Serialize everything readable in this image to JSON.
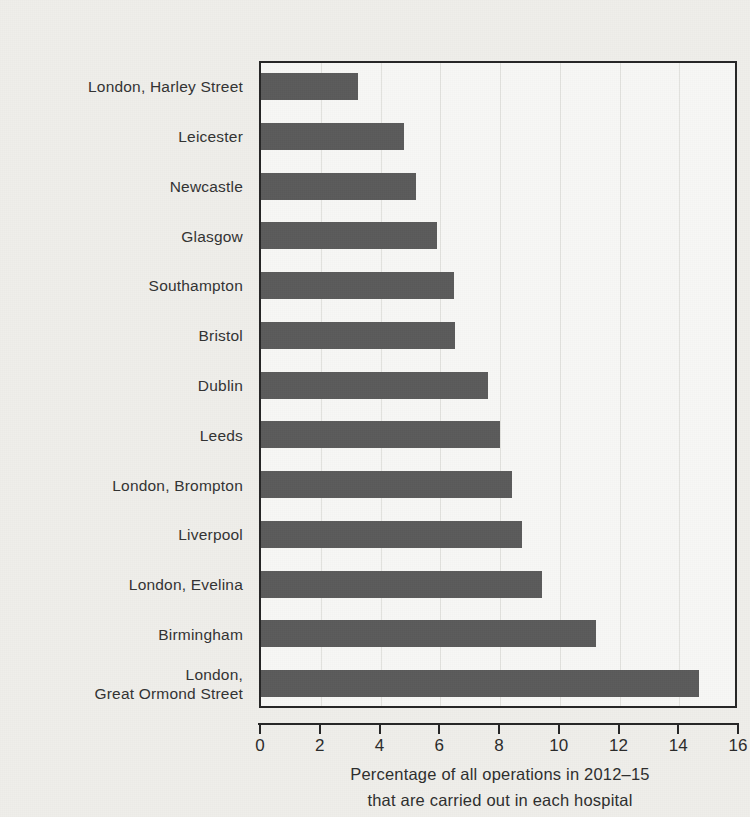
{
  "chart_data": {
    "type": "bar",
    "orientation": "horizontal",
    "title": "",
    "xlabel_lines": [
      "Percentage of all operations in 2012–15",
      "that are carried out in each hospital"
    ],
    "ylabel": "",
    "xlim": [
      0,
      16
    ],
    "xticks": [
      0,
      2,
      4,
      6,
      8,
      10,
      12,
      14,
      16
    ],
    "xtick_labels": [
      "0",
      "2",
      "4",
      "6",
      "8",
      "10",
      "12",
      "14",
      "16"
    ],
    "grid": "vertical-faint",
    "legend": "none",
    "bar_color": "#5b5b5b",
    "categories": [
      "London, Harley Street",
      "Leicester",
      "Newcastle",
      "Glasgow",
      "Southampton",
      "Bristol",
      "Dublin",
      "Leeds",
      "London, Brompton",
      "Liverpool",
      "London, Evelina",
      "Birmingham",
      "London,\nGreat Ormond Street"
    ],
    "category_lines": [
      [
        "London, Harley Street"
      ],
      [
        "Leicester"
      ],
      [
        "Newcastle"
      ],
      [
        "Glasgow"
      ],
      [
        "Southampton"
      ],
      [
        "Bristol"
      ],
      [
        "Dublin"
      ],
      [
        "Leeds"
      ],
      [
        "London, Brompton"
      ],
      [
        "Liverpool"
      ],
      [
        "London, Evelina"
      ],
      [
        "Birmingham"
      ],
      [
        "London,",
        "Great Ormond Street"
      ]
    ],
    "values": [
      3.25,
      4.8,
      5.2,
      5.9,
      6.45,
      6.5,
      7.6,
      8.0,
      8.4,
      8.75,
      9.4,
      11.2,
      14.65
    ]
  },
  "colors": {
    "bar": "#5b5b5b",
    "axis": "#262626",
    "background": "#efeeea",
    "plot_background": "#f7f7f5",
    "gridline": "#e2e2de",
    "text": "#2e2e2e"
  }
}
